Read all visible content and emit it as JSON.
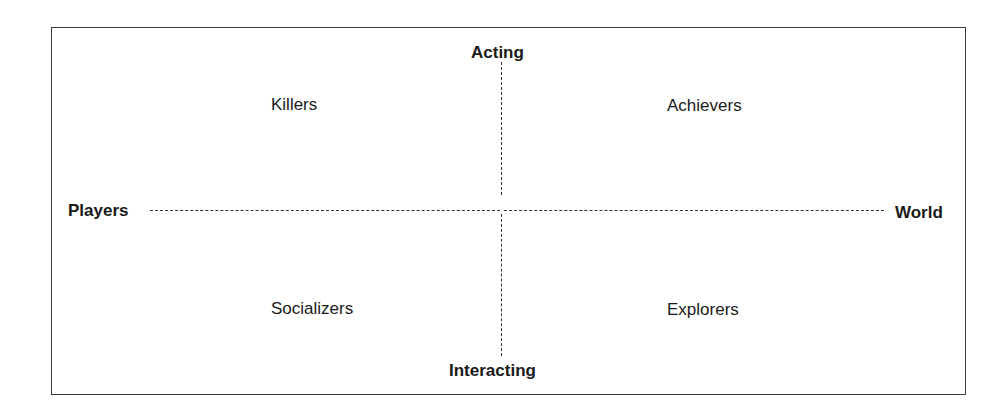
{
  "diagram": {
    "axes": {
      "top": "Acting",
      "bottom": "Interacting",
      "left": "Players",
      "right": "World"
    },
    "quadrants": {
      "top_left": "Killers",
      "top_right": "Achievers",
      "bottom_left": "Socializers",
      "bottom_right": "Explorers"
    }
  }
}
